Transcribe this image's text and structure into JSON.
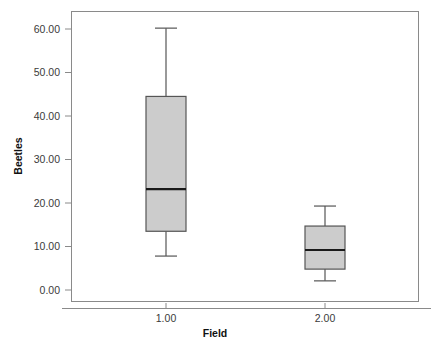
{
  "chart_data": {
    "type": "box",
    "title": "",
    "subtitle": "",
    "xlabel": "Field",
    "ylabel": "Beetles",
    "categories": [
      "1.00",
      "2.00"
    ],
    "ytick_labels": [
      "0.00",
      "10.00",
      "20.00",
      "30.00",
      "40.00",
      "50.00",
      "60.00"
    ],
    "ytick_values": [
      0,
      10,
      20,
      30,
      40,
      50,
      60
    ],
    "ylim": [
      0,
      60
    ],
    "grid": false,
    "legend": "none",
    "boxes": [
      {
        "category": "1.00",
        "whisker_low": 7.8,
        "q1": 13.5,
        "median": 23.2,
        "q3": 44.5,
        "whisker_high": 60.2,
        "outliers": []
      },
      {
        "category": "2.00",
        "whisker_low": 2.1,
        "q1": 4.8,
        "median": 9.2,
        "q3": 14.7,
        "whisker_high": 19.3,
        "outliers": []
      }
    ],
    "colors": {
      "box_fill": "#cccccc",
      "box_stroke": "#555555",
      "median_stroke": "#1a1a1a",
      "whisker_stroke": "#555555",
      "frame_stroke": "#8a8a8a",
      "axis_text": "#3a3a3a",
      "background": "#ffffff"
    }
  }
}
